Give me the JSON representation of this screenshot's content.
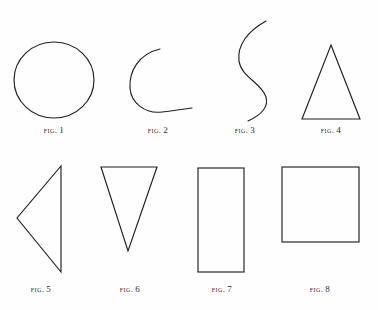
{
  "plate": {
    "background_color": "#fefefe",
    "ink_color": "#1f1f1f",
    "width": 378,
    "height": 310,
    "caption_word": "Fig.",
    "description": "Plate of eight outlined geometric figures arranged in two rows of four, each with a Fig. caption beneath"
  },
  "figures": [
    {
      "id": "fig-1",
      "shape": "circle",
      "shape_name": "circle-outline",
      "caption_word": "Fig.",
      "number": "1",
      "caption_x": 54,
      "caption_y": 125,
      "row": 1
    },
    {
      "id": "fig-2",
      "shape": "arc",
      "shape_name": "open-arc-outline",
      "caption_word": "Fig.",
      "number": "2",
      "caption_x": 158,
      "caption_y": 125,
      "row": 1
    },
    {
      "id": "fig-3",
      "shape": "s-curve",
      "shape_name": "s-curve-outline",
      "caption_word": "Fig.",
      "number": "3",
      "caption_x": 245,
      "caption_y": 125,
      "row": 1
    },
    {
      "id": "fig-4",
      "shape": "triangle-up",
      "shape_name": "triangle-up-outline",
      "caption_word": "Fig.",
      "number": "4",
      "caption_x": 331,
      "caption_y": 125,
      "row": 1
    },
    {
      "id": "fig-5",
      "shape": "triangle-left",
      "shape_name": "triangle-left-outline",
      "caption_word": "Fig.",
      "number": "5",
      "caption_x": 41,
      "caption_y": 284,
      "row": 2
    },
    {
      "id": "fig-6",
      "shape": "triangle-down",
      "shape_name": "triangle-down-outline",
      "caption_word": "Fig.",
      "number": "6",
      "caption_x": 130,
      "caption_y": 284,
      "row": 2
    },
    {
      "id": "fig-7",
      "shape": "rectangle",
      "shape_name": "rectangle-outline",
      "caption_word": "Fig.",
      "number": "7",
      "caption_x": 222,
      "caption_y": 284,
      "row": 2
    },
    {
      "id": "fig-8",
      "shape": "square",
      "shape_name": "square-outline",
      "caption_word": "Fig.",
      "number": "8",
      "caption_x": 320,
      "caption_y": 284,
      "row": 2
    }
  ]
}
